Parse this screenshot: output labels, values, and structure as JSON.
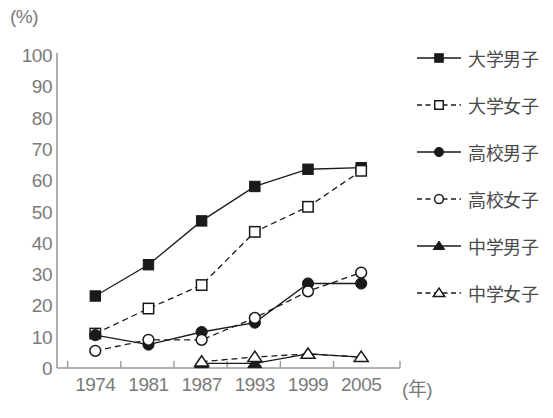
{
  "chart_data": {
    "type": "line",
    "title": "",
    "xlabel": "(年)",
    "ylabel": "(%)",
    "unit_label": "(%)",
    "x_unit_label": "(年)",
    "categories": [
      "1974",
      "1981",
      "1987",
      "1993",
      "1999",
      "2005"
    ],
    "xlim": [
      0,
      5
    ],
    "ylim": [
      0,
      100
    ],
    "ytick_labels": [
      "0",
      "10",
      "20",
      "30",
      "40",
      "50",
      "60",
      "70",
      "80",
      "90",
      "100"
    ],
    "ytick_values": [
      0,
      10,
      20,
      30,
      40,
      50,
      60,
      70,
      80,
      90,
      100
    ],
    "grid": false,
    "legend_position": "right",
    "series": [
      {
        "name": "大学男子",
        "marker": "filled-square",
        "line": "solid",
        "color": "#1a1a1a",
        "values": [
          23,
          33,
          47,
          58,
          63.5,
          64
        ]
      },
      {
        "name": "大学女子",
        "marker": "open-square",
        "line": "dashed",
        "color": "#1a1a1a",
        "values": [
          11,
          19,
          26.5,
          43.5,
          51.5,
          63
        ]
      },
      {
        "name": "高校男子",
        "marker": "filled-circle",
        "line": "solid",
        "color": "#1a1a1a",
        "values": [
          10.5,
          7.5,
          11.5,
          14.5,
          27,
          27
        ]
      },
      {
        "name": "高校女子",
        "marker": "open-circle",
        "line": "dashed",
        "color": "#1a1a1a",
        "values": [
          5.5,
          9,
          9,
          16,
          24.5,
          30.5
        ]
      },
      {
        "name": "中学男子",
        "marker": "filled-triangle",
        "line": "solid",
        "color": "#1a1a1a",
        "values": [
          null,
          null,
          1.5,
          1.5,
          4.5,
          3.5
        ]
      },
      {
        "name": "中学女子",
        "marker": "open-triangle",
        "line": "dashed",
        "color": "#1a1a1a",
        "values": [
          null,
          null,
          2,
          3.5,
          4.5,
          3.5
        ]
      }
    ]
  },
  "legend": {
    "items": [
      {
        "label": "大学男子",
        "marker": "filled-square",
        "line": "solid"
      },
      {
        "label": "大学女子",
        "marker": "open-square",
        "line": "dashed"
      },
      {
        "label": "高校男子",
        "marker": "filled-circle",
        "line": "solid"
      },
      {
        "label": "高校女子",
        "marker": "open-circle",
        "line": "dashed"
      },
      {
        "label": "中学男子",
        "marker": "filled-triangle",
        "line": "solid"
      },
      {
        "label": "中学女子",
        "marker": "open-triangle",
        "line": "dashed"
      }
    ]
  },
  "caption": {
    "text": ""
  },
  "colors": {
    "axis": "#9a9a9a",
    "ink": "#1a1a1a",
    "tick_text": "#7a7a7a",
    "legend_text": "#4a4a4a"
  }
}
